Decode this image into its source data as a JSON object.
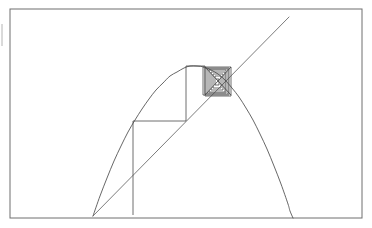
{
  "figure": {
    "background_color": "#ffffff",
    "width": 372,
    "height": 228,
    "frame": {
      "label": "plot-frame",
      "color": "#6e6e6e",
      "x": 10,
      "y": 9,
      "width": 352,
      "height": 209
    },
    "left_tick": {
      "label": "left-edge-tick",
      "color": "#b4b4b4",
      "x": 2,
      "y1": 24,
      "y2": 46
    }
  },
  "chart_data": {
    "type": "line",
    "subtitle": "",
    "xlabel": "",
    "ylabel": "",
    "xlim": [
      10,
      362
    ],
    "ylim": [
      218,
      9
    ],
    "grid": false,
    "legend": null,
    "annotations": [],
    "series": [
      {
        "name": "map-curve",
        "kind": "parabola",
        "color": "#4c4c4c",
        "description": "Downward opening quadratic map curve",
        "vertex": [
          190,
          66
        ],
        "start": [
          93,
          216
        ],
        "end": [
          290,
          218
        ],
        "points": [
          [
            93,
            216
          ],
          [
            100,
            196
          ],
          [
            107,
            178
          ],
          [
            114,
            161
          ],
          [
            121,
            146
          ],
          [
            128,
            132
          ],
          [
            135,
            120
          ],
          [
            142,
            109
          ],
          [
            149,
            99
          ],
          [
            156,
            90
          ],
          [
            163,
            83
          ],
          [
            170,
            76
          ],
          [
            177,
            72
          ],
          [
            184,
            68
          ],
          [
            190,
            66
          ],
          [
            197,
            66
          ],
          [
            204,
            67
          ],
          [
            211,
            70
          ],
          [
            218,
            74
          ],
          [
            225,
            80
          ],
          [
            232,
            88
          ],
          [
            239,
            97
          ],
          [
            246,
            108
          ],
          [
            253,
            120
          ],
          [
            260,
            134
          ],
          [
            267,
            149
          ],
          [
            274,
            166
          ],
          [
            281,
            184
          ],
          [
            288,
            204
          ],
          [
            290,
            211
          ],
          [
            293,
            218
          ]
        ]
      },
      {
        "name": "identity-line",
        "kind": "line",
        "color": "#5a5a5a",
        "description": "Diagonal identity line y = x",
        "start": [
          93,
          216
        ],
        "end": [
          289,
          17
        ]
      },
      {
        "name": "cobweb-path",
        "kind": "staircase",
        "color": "#4a4a4a",
        "description": "Staircase path of successive iterates converging to the fixed point",
        "points": [
          [
            133,
            215
          ],
          [
            133,
            121
          ],
          [
            186,
            121
          ],
          [
            186,
            66
          ],
          [
            205,
            66
          ],
          [
            205,
            96
          ],
          [
            231,
            96
          ],
          [
            231,
            67
          ],
          [
            203,
            67
          ],
          [
            203,
            95
          ],
          [
            229,
            95
          ],
          [
            229,
            68
          ],
          [
            205,
            68
          ],
          [
            205,
            94
          ],
          [
            228,
            94
          ],
          [
            228,
            69
          ],
          [
            207,
            69
          ],
          [
            207,
            93
          ],
          [
            226,
            93
          ],
          [
            226,
            70
          ],
          [
            209,
            70
          ],
          [
            209,
            92
          ],
          [
            225,
            92
          ],
          [
            225,
            72
          ],
          [
            211,
            72
          ],
          [
            211,
            90
          ],
          [
            223,
            90
          ],
          [
            223,
            74
          ],
          [
            213,
            74
          ],
          [
            213,
            88
          ],
          [
            221,
            88
          ],
          [
            221,
            76
          ],
          [
            215,
            76
          ],
          [
            215,
            85
          ],
          [
            219,
            85
          ],
          [
            219,
            79
          ],
          [
            216,
            79
          ]
        ]
      },
      {
        "name": "fixed-point-diagonals",
        "kind": "diagonals",
        "color": "#3f3f3f",
        "description": "Diagonal cross inside the innermost convergence square",
        "segments": [
          [
            [
              205,
              67
            ],
            [
              231,
              95
            ]
          ],
          [
            [
              231,
              67
            ],
            [
              205,
              95
            ]
          ]
        ]
      }
    ]
  }
}
